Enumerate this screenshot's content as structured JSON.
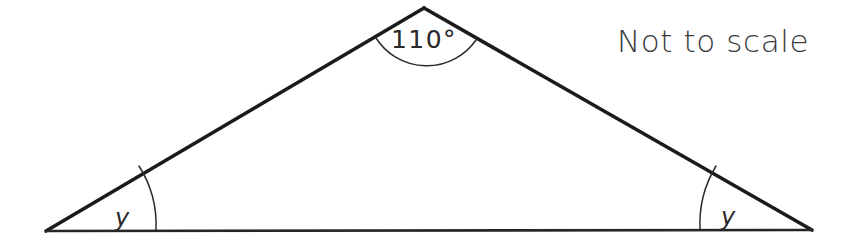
{
  "figure": {
    "kind": "geometry-diagram",
    "shape": "isosceles-triangle",
    "background_color": "#ffffff",
    "stroke_color": "#1b1b1b",
    "note": {
      "text": "Not to scale",
      "color": "#3a3a3a"
    },
    "angles": [
      {
        "id": "apex",
        "label": "110°",
        "value": 110,
        "unit": "degrees",
        "position": "top",
        "vertex": {
          "x": 424,
          "y": 8
        },
        "arc_radius": 52
      },
      {
        "id": "base-left",
        "label": "y",
        "value": null,
        "unit": "degrees",
        "position": "bottom-left",
        "vertex": {
          "x": 46,
          "y": 231
        },
        "arc_radius": 110
      },
      {
        "id": "base-right",
        "label": "y",
        "value": null,
        "unit": "degrees",
        "position": "bottom-right",
        "vertex": {
          "x": 812,
          "y": 230
        },
        "arc_radius": 112
      }
    ],
    "vertices": {
      "left": {
        "x": 46,
        "y": 231
      },
      "apex": {
        "x": 424,
        "y": 8
      },
      "right": {
        "x": 812,
        "y": 230
      }
    }
  }
}
